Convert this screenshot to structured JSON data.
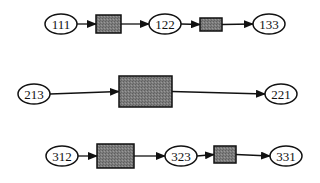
{
  "diagram": {
    "colors": {
      "stroke": "#111111",
      "box_fill": "#7a7a7a",
      "ellipse_fill": "#ffffff",
      "background": "#ffffff"
    },
    "rows": [
      {
        "nodes": [
          {
            "type": "ellipse",
            "label": "111",
            "cx": 61,
            "cy": 24,
            "rx": 16,
            "ry": 10
          },
          {
            "type": "box",
            "x": 96,
            "y": 15,
            "w": 25,
            "h": 18
          },
          {
            "type": "ellipse",
            "label": "122",
            "cx": 165,
            "cy": 24,
            "rx": 16,
            "ry": 10
          },
          {
            "type": "box",
            "x": 200,
            "y": 18,
            "w": 22,
            "h": 13
          },
          {
            "type": "ellipse",
            "label": "133",
            "cx": 269,
            "cy": 24,
            "rx": 16,
            "ry": 10
          }
        ]
      },
      {
        "nodes": [
          {
            "type": "ellipse",
            "label": "213",
            "cx": 34,
            "cy": 94,
            "rx": 16,
            "ry": 10
          },
          {
            "type": "box",
            "x": 119,
            "y": 76,
            "w": 53,
            "h": 31
          },
          {
            "type": "ellipse",
            "label": "221",
            "cx": 281,
            "cy": 94,
            "rx": 16,
            "ry": 10
          }
        ]
      },
      {
        "nodes": [
          {
            "type": "ellipse",
            "label": "312",
            "cx": 62,
            "cy": 156,
            "rx": 16,
            "ry": 10
          },
          {
            "type": "box",
            "x": 97,
            "y": 144,
            "w": 37,
            "h": 24
          },
          {
            "type": "ellipse",
            "label": "323",
            "cx": 181,
            "cy": 156,
            "rx": 16,
            "ry": 10
          },
          {
            "type": "box",
            "x": 214,
            "y": 146,
            "w": 22,
            "h": 17
          },
          {
            "type": "ellipse",
            "label": "331",
            "cx": 286,
            "cy": 156,
            "rx": 16,
            "ry": 10
          }
        ]
      }
    ]
  }
}
